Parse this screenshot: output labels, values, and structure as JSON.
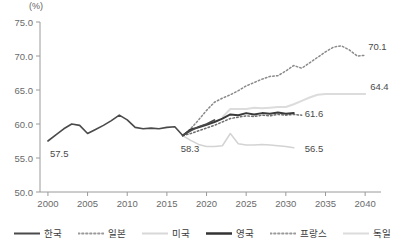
{
  "chart_data": {
    "type": "line",
    "title": "",
    "xlabel": "",
    "ylabel": "(%)",
    "unit_label": "(%)",
    "xlim": [
      1999,
      2042
    ],
    "ylim": [
      50.0,
      75.0
    ],
    "grid": false,
    "legend_position": "bottom",
    "x_ticks": [
      "2000",
      "2005",
      "2010",
      "2015",
      "2020",
      "2025",
      "2030",
      "2035",
      "2040"
    ],
    "x_tick_values": [
      2000,
      2005,
      2010,
      2015,
      2020,
      2025,
      2030,
      2035,
      2040
    ],
    "y_ticks": [
      "50.0",
      "55.0",
      "60.0",
      "65.0",
      "70.0",
      "75.0"
    ],
    "y_tick_values": [
      50.0,
      55.0,
      60.0,
      65.0,
      70.0,
      75.0
    ],
    "annotations": [
      {
        "text": "57.5",
        "x": 2000,
        "y": 57.5,
        "series": "한국"
      },
      {
        "text": "58.3",
        "x": 2017,
        "y": 58.3,
        "series": "한국"
      },
      {
        "text": "61.6",
        "x": 2031,
        "y": 61.6,
        "series": "영국"
      },
      {
        "text": "64.4",
        "x": 2040,
        "y": 64.4,
        "series": "독일"
      },
      {
        "text": "70.1",
        "x": 2040,
        "y": 70.1,
        "series": "일본"
      },
      {
        "text": "56.5",
        "x": 2031,
        "y": 56.5,
        "series": "미국"
      }
    ],
    "series": [
      {
        "name": "한국",
        "style": "solid",
        "color": "#4a4a4a",
        "width": 1.6,
        "x": [
          2000,
          2001,
          2002,
          2003,
          2004,
          2005,
          2006,
          2007,
          2008,
          2009,
          2010,
          2011,
          2012,
          2013,
          2014,
          2015,
          2016,
          2017,
          2018,
          2019,
          2020,
          2021
        ],
        "values": [
          57.5,
          58.4,
          59.3,
          60.0,
          59.8,
          58.6,
          59.2,
          59.8,
          60.5,
          61.3,
          60.6,
          59.5,
          59.3,
          59.4,
          59.3,
          59.5,
          59.6,
          58.3,
          59.0,
          59.6,
          60.0,
          60.6
        ]
      },
      {
        "name": "일본",
        "style": "dotted",
        "color": "#8a8a8a",
        "width": 1.5,
        "x": [
          2017,
          2018,
          2019,
          2020,
          2021,
          2022,
          2023,
          2024,
          2025,
          2026,
          2027,
          2028,
          2029,
          2030,
          2031,
          2032,
          2033,
          2034,
          2035,
          2036,
          2037,
          2038,
          2039,
          2040
        ],
        "values": [
          58.3,
          59.3,
          60.6,
          62.0,
          63.2,
          63.8,
          64.3,
          64.9,
          65.6,
          66.1,
          66.6,
          67.0,
          67.1,
          67.8,
          68.6,
          68.2,
          69.0,
          69.8,
          70.6,
          71.3,
          71.5,
          70.9,
          70.0,
          70.1
        ]
      },
      {
        "name": "미국",
        "style": "solid",
        "color": "#d3d3d3",
        "width": 1.5,
        "x": [
          2017,
          2018,
          2019,
          2020,
          2021,
          2022,
          2023,
          2024,
          2025,
          2026,
          2027,
          2028,
          2029,
          2030,
          2031
        ],
        "values": [
          58.3,
          57.6,
          57.0,
          56.7,
          56.7,
          56.8,
          58.6,
          57.1,
          56.9,
          56.9,
          57.0,
          56.9,
          56.8,
          56.7,
          56.5
        ]
      },
      {
        "name": "영국",
        "style": "solid",
        "color": "#3a3a3a",
        "width": 2.0,
        "x": [
          2017,
          2018,
          2019,
          2020,
          2021,
          2022,
          2023,
          2024,
          2025,
          2026,
          2027,
          2028,
          2029,
          2030,
          2031
        ],
        "values": [
          58.3,
          59.2,
          59.5,
          59.9,
          60.3,
          60.8,
          61.4,
          61.3,
          61.6,
          61.4,
          61.6,
          61.5,
          61.7,
          61.5,
          61.6
        ]
      },
      {
        "name": "프랑스",
        "style": "dotted",
        "color": "#6f6f6f",
        "width": 1.5,
        "x": [
          2017,
          2018,
          2019,
          2020,
          2021,
          2022,
          2023,
          2024,
          2025,
          2026,
          2027,
          2028,
          2029,
          2030,
          2031,
          2032
        ],
        "values": [
          58.3,
          58.6,
          59.0,
          59.4,
          59.8,
          60.3,
          60.8,
          61.0,
          61.2,
          61.1,
          61.3,
          61.2,
          61.4,
          61.3,
          61.4,
          61.3
        ]
      },
      {
        "name": "독일",
        "style": "solid",
        "color": "#dcdcdc",
        "width": 2.0,
        "x": [
          2022,
          2023,
          2024,
          2025,
          2026,
          2027,
          2028,
          2029,
          2030,
          2031,
          2032,
          2033,
          2034,
          2035,
          2036,
          2037,
          2038,
          2039,
          2040
        ],
        "values": [
          61.0,
          62.2,
          62.2,
          62.2,
          62.4,
          62.3,
          62.4,
          62.5,
          62.5,
          62.9,
          63.4,
          63.9,
          64.3,
          64.4,
          64.4,
          64.4,
          64.4,
          64.4,
          64.4
        ]
      }
    ]
  },
  "legend": {
    "items": [
      {
        "label": "한국",
        "style": "solid",
        "color": "#4a4a4a",
        "width": 2.2
      },
      {
        "label": "일본",
        "style": "dotted",
        "color": "#9a9a9a",
        "width": 1.8
      },
      {
        "label": "미국",
        "style": "solid",
        "color": "#d8d8d8",
        "width": 1.8
      },
      {
        "label": "영국",
        "style": "solid",
        "color": "#333333",
        "width": 2.6
      },
      {
        "label": "프랑스",
        "style": "dotted",
        "color": "#9a9a9a",
        "width": 1.8
      },
      {
        "label": "독일",
        "style": "solid",
        "color": "#dcdcdc",
        "width": 2.2
      }
    ]
  },
  "axis": {
    "line_color": "#9a9a9a",
    "tick_label_color": "#6a6a6a"
  }
}
